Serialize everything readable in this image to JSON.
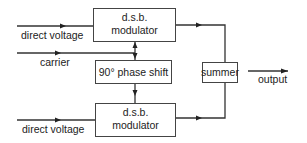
{
  "diagram": {
    "type": "block-diagram",
    "blocks": {
      "top_modulator": {
        "line1": "d.s.b.",
        "line2": "modulator"
      },
      "phase_shift": {
        "label": "90° phase shift"
      },
      "bottom_modulator": {
        "line1": "d.s.b.",
        "line2": "modulator"
      },
      "summer": {
        "label": "summer"
      }
    },
    "inputs": {
      "top_direct_voltage": "direct voltage",
      "carrier": "carrier",
      "bottom_direct_voltage": "direct voltage"
    },
    "outputs": {
      "output": "output"
    },
    "connections": [
      {
        "from": "direct voltage (top)",
        "to": "d.s.b. modulator (top)"
      },
      {
        "from": "carrier",
        "to": "d.s.b. modulator (top)"
      },
      {
        "from": "carrier",
        "to": "90° phase shift"
      },
      {
        "from": "90° phase shift",
        "to": "d.s.b. modulator (bottom)"
      },
      {
        "from": "direct voltage (bottom)",
        "to": "d.s.b. modulator (bottom)"
      },
      {
        "from": "d.s.b. modulator (top)",
        "to": "summer"
      },
      {
        "from": "d.s.b. modulator (bottom)",
        "to": "summer"
      },
      {
        "from": "summer",
        "to": "output"
      }
    ],
    "colors": {
      "stroke": "#333333",
      "text": "#222222",
      "background": "#ffffff"
    }
  }
}
